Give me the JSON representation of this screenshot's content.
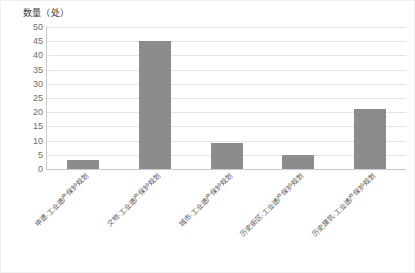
{
  "chart_data": {
    "type": "bar",
    "title": "数量（处）",
    "xlabel": "",
    "ylabel": "数量（处）",
    "categories": [
      "申遗·工业遗产保护规划",
      "文物·工业遗产保护规划",
      "城市·工业遗产保护规划",
      "历史街区·工业遗产保护规划",
      "历史建筑·工业遗产保护规划"
    ],
    "values": [
      3,
      45,
      9,
      5,
      21
    ],
    "ylim": [
      0,
      50
    ],
    "yticks": [
      50,
      45,
      40,
      35,
      30,
      25,
      20,
      15,
      10,
      5,
      0
    ],
    "ytick_labels": [
      "50",
      "45",
      "40",
      "35",
      "30",
      "25",
      "20",
      "15",
      "10",
      "5",
      "0"
    ],
    "grid": true,
    "legend": false,
    "bar_color": "#8c8c8c",
    "grid_color": "#e4e4e4",
    "axis_color": "#c9c9c9",
    "background": "#ffffff"
  }
}
